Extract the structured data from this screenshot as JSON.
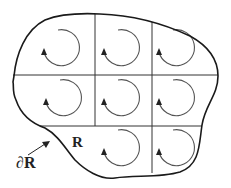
{
  "diagram": {
    "region_label": "R",
    "boundary_label": "∂R",
    "colors": {
      "stroke": "#1a1a1a",
      "grid": "#333333",
      "circulation": "#444444",
      "background": "#ffffff"
    },
    "grid": {
      "rows": 3,
      "cols": 3,
      "cells_with_circulation": 8
    },
    "circulation_direction": "counterclockwise"
  }
}
